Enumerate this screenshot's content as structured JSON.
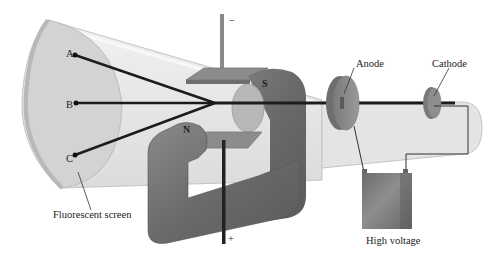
{
  "diagram": {
    "labels": {
      "anode": "Anode",
      "cathode": "Cathode",
      "fluorescent_screen": "Fluorescent screen",
      "high_voltage": "High voltage",
      "point_a": "A",
      "point_b": "B",
      "point_c": "C",
      "magnet_north": "N",
      "magnet_south": "S",
      "plate_negative": "−",
      "plate_positive": "+"
    },
    "colors": {
      "tube_glass": "#e8e8e8",
      "tube_edge": "#c8c8c8",
      "screen": "#d2d2d2",
      "magnet": "#6e6e6e",
      "plate": "#8c8c8c",
      "beam": "#1c1c1c",
      "electrode": "#8a8a8a",
      "battery": "#7a7a7a"
    }
  }
}
